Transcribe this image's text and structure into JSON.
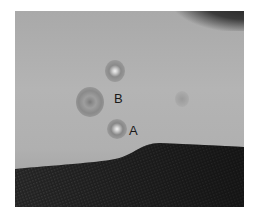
{
  "image": {
    "description": "Clinical photograph of a forearm/wrist showing circular target-like skin lesions resting on dark textured fabric",
    "labels": [
      {
        "id": "B",
        "text": "B"
      },
      {
        "id": "A",
        "text": "A"
      }
    ],
    "colors": {
      "skin": "#b0b0b0",
      "fabric": "#202020",
      "background": "#ffffff"
    }
  }
}
